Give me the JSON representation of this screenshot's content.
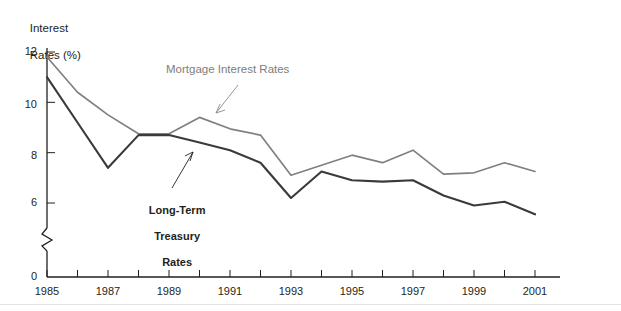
{
  "chart_data": {
    "type": "line",
    "title": "",
    "ylabel": "Interest\nRates (%)",
    "xlabel": "",
    "x": [
      1985,
      1986,
      1987,
      1988,
      1989,
      1990,
      1991,
      1992,
      1993,
      1994,
      1995,
      1996,
      1997,
      1998,
      1999,
      2000,
      2001
    ],
    "xtick_labels": [
      "1985",
      "1987",
      "1989",
      "1991",
      "1993",
      "1995",
      "1997",
      "1999",
      "2001"
    ],
    "xtick_values": [
      1985,
      1987,
      1989,
      1991,
      1993,
      1995,
      1997,
      1999,
      2001
    ],
    "ytick_labels": [
      "0",
      "6",
      "8",
      "10",
      "12"
    ],
    "ytick_values": [
      0,
      6,
      8,
      10,
      12
    ],
    "ylim": [
      0,
      12
    ],
    "axis_break": true,
    "grid": false,
    "legend_position": "inline-annotations",
    "series": [
      {
        "name": "Mortgage Interest Rates",
        "color": "#808080",
        "values": [
          11.8,
          10.4,
          9.5,
          8.75,
          8.75,
          9.4,
          8.95,
          8.7,
          7.1,
          7.5,
          7.9,
          7.6,
          8.1,
          7.15,
          7.2,
          7.6,
          7.25
        ]
      },
      {
        "name": "Long-Term Treasury Rates",
        "color": "#3a3a3a",
        "values": [
          11.0,
          9.2,
          7.4,
          8.7,
          8.7,
          8.4,
          8.1,
          7.6,
          6.2,
          7.25,
          6.9,
          6.85,
          6.9,
          6.3,
          5.9,
          6.05,
          5.55
        ]
      }
    ],
    "annotations": [
      {
        "name": "Mortgage Interest Rates",
        "text": "Mortgage Interest Rates",
        "color": "#808080"
      },
      {
        "name": "Long-Term Treasury Rates",
        "text": "Long-Term\nTreasury\nRates",
        "color": "#231f20"
      }
    ]
  },
  "axis": {
    "y_title_line1": "Interest",
    "y_title_line2": "Rates (%)",
    "y_labels": {
      "v12": "12",
      "v10": "10",
      "v8": "8",
      "v6": "6",
      "v0": "0"
    },
    "x_labels": {
      "y1985": "1985",
      "y1987": "1987",
      "y1989": "1989",
      "y1991": "1991",
      "y1993": "1993",
      "y1995": "1995",
      "y1997": "1997",
      "y1999": "1999",
      "y2001": "2001"
    }
  },
  "labels": {
    "mortgage_line1": "Mortgage Interest Rates",
    "treasury_line1": "Long-Term",
    "treasury_line2": "Treasury",
    "treasury_line3": "Rates"
  }
}
